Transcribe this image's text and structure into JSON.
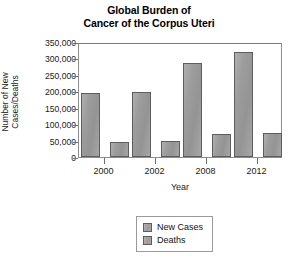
{
  "chart_data": {
    "type": "bar",
    "title": "Global Burden of Cancer of the Corpus Uteri",
    "title_lines": [
      "Global Burden of",
      "Cancer of the Corpus Uteri"
    ],
    "xlabel": "Year",
    "ylabel": "Number of New Cases/Deaths",
    "ylabel_lines": [
      "Number of New",
      "Cases/Deaths"
    ],
    "categories": [
      "2000",
      "2002",
      "2008",
      "2012"
    ],
    "series": [
      {
        "name": "New Cases",
        "values": [
          195000,
          199000,
          287000,
          320000
        ],
        "color": "#9d9d9d"
      },
      {
        "name": "Deaths",
        "values": [
          45000,
          48000,
          70000,
          72000
        ],
        "color": "#9d9d9d"
      }
    ],
    "ylim": [
      0,
      350000
    ],
    "yticks": [
      0,
      50000,
      100000,
      150000,
      200000,
      250000,
      300000,
      350000
    ],
    "ytick_labels": [
      "0",
      "50,000",
      "100,000",
      "150,000",
      "200,000",
      "250,000",
      "300,000",
      "350,000"
    ],
    "grid": false,
    "legend_position": "bottom-center",
    "legend_entries": [
      "New Cases",
      "Deaths"
    ]
  }
}
